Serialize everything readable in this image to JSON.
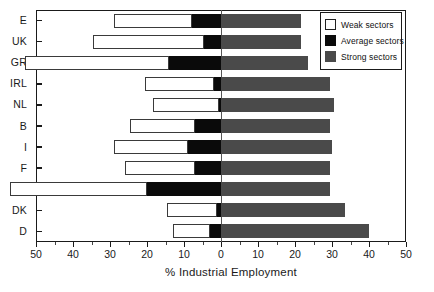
{
  "chart_data": {
    "type": "bar",
    "title": "",
    "xlabel": "% Industrial Employment",
    "ylabel": "",
    "xlim": [
      -50,
      50
    ],
    "xticks": [
      -50,
      -40,
      -30,
      -20,
      -10,
      0,
      10,
      20,
      30,
      40,
      50
    ],
    "xticklabels": [
      "50",
      "40",
      "30",
      "20",
      "10",
      "0",
      "10",
      "20",
      "30",
      "40",
      "50"
    ],
    "grid": false,
    "orientation": "horizontal",
    "stacked": true,
    "diverging": true,
    "note": "Weak and Average sectors are plotted to the left of zero; Strong sectors to the right.",
    "categories": [
      "E",
      "UK",
      "GR",
      "IRL",
      "NL",
      "B",
      "I",
      "F",
      "P",
      "DK",
      "D"
    ],
    "series": [
      {
        "name": "Weak sectors",
        "color": "#ffffff",
        "values": [
          21.0,
          30.0,
          39.0,
          18.5,
          18.0,
          17.5,
          20.0,
          19.0,
          37.0,
          13.5,
          10.0
        ]
      },
      {
        "name": "Average sectors",
        "color": "#0a0a0a",
        "values": [
          7.8,
          4.5,
          14.0,
          2.0,
          0.5,
          7.0,
          9.0,
          7.0,
          20.0,
          1.0,
          3.0
        ]
      },
      {
        "name": "Strong sectors",
        "color": "#4a4a4a",
        "values": [
          21.5,
          21.5,
          23.5,
          29.5,
          30.5,
          29.5,
          30.0,
          29.5,
          29.5,
          33.5,
          40.0
        ]
      }
    ],
    "legend": {
      "position": "top-right",
      "entries": [
        {
          "label": "Weak sectors",
          "swatch": "weak"
        },
        {
          "label": "Average sectors",
          "swatch": "avg"
        },
        {
          "label": "Strong sectors",
          "swatch": "strong"
        }
      ]
    }
  }
}
